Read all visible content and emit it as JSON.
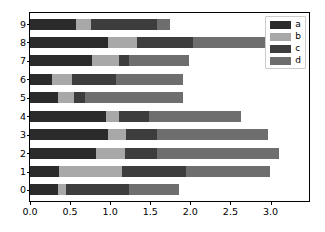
{
  "chart_data": {
    "type": "bar",
    "orientation": "horizontal",
    "stacked": true,
    "title": "",
    "xlabel": "",
    "ylabel": "",
    "xlim": [
      0.0,
      3.48
    ],
    "ylim": [
      -0.6,
      9.6
    ],
    "grid": false,
    "legend_position": "upper right",
    "xticks": [
      0.0,
      0.5,
      1.0,
      1.5,
      2.0,
      2.5,
      3.0
    ],
    "xticklabels": [
      "0.0",
      "0.5",
      "1.0",
      "1.5",
      "2.0",
      "2.5",
      "3.0"
    ],
    "categories": [
      "0",
      "1",
      "2",
      "3",
      "4",
      "5",
      "6",
      "7",
      "8",
      "9"
    ],
    "yticklabels": [
      "0",
      "1",
      "2",
      "3",
      "4",
      "5",
      "6",
      "7",
      "8",
      "9"
    ],
    "colors": {
      "a": "#2b2b2b",
      "b": "#a8a8a8",
      "c": "#3d3d3d",
      "d": "#6e6e6e"
    },
    "series": [
      {
        "name": "a",
        "color": "#2b2b2b",
        "values": [
          0.35,
          0.36,
          0.82,
          0.97,
          0.95,
          0.35,
          0.28,
          0.77,
          0.97,
          0.57
        ]
      },
      {
        "name": "b",
        "color": "#a8a8a8",
        "values": [
          0.1,
          0.79,
          0.36,
          0.23,
          0.16,
          0.2,
          0.24,
          0.34,
          0.37,
          0.19
        ]
      },
      {
        "name": "c",
        "color": "#3d3d3d",
        "values": [
          0.79,
          0.79,
          0.4,
          0.39,
          0.37,
          0.14,
          0.55,
          0.12,
          0.69,
          0.83
        ]
      },
      {
        "name": "d",
        "color": "#6e6e6e",
        "values": [
          0.62,
          1.06,
          1.53,
          1.38,
          1.15,
          1.22,
          0.84,
          0.75,
          0.92,
          0.16
        ]
      }
    ],
    "totals": [
      1.86,
      3.0,
      3.11,
      2.97,
      2.63,
      1.91,
      1.91,
      1.98,
      2.95,
      1.75
    ]
  },
  "legend": {
    "entries": [
      {
        "label": "a"
      },
      {
        "label": "b"
      },
      {
        "label": "c"
      },
      {
        "label": "d"
      }
    ]
  }
}
